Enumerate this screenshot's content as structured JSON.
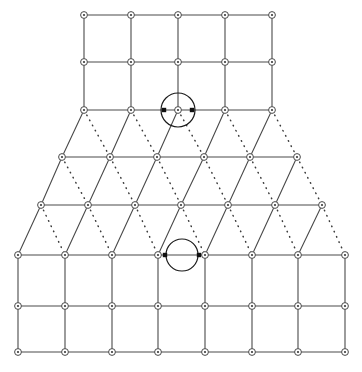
{
  "figure": {
    "title": "",
    "width": 362,
    "height": 372,
    "background_color": "#ffffff",
    "line_color": "#4a4a4a",
    "dotted_line_color": "#3b3b3b",
    "site_fill_color": "#ffffff",
    "site_dot_color": "#3a3a3a",
    "highlight_color": "#1a1a1a",
    "marker_color": "#111111"
  },
  "lattice": {
    "description": "trapezoidal lattice: square grid top, triangular lattice middle, square grid bottom",
    "site_radius": 3.4,
    "site_dot_radius": 1.1,
    "regions": [
      {
        "name": "top-square-grid",
        "type": "square",
        "rows": 3,
        "cols": 5,
        "x_start": 84,
        "x_step": 47,
        "y_start": 15,
        "y_step": 47
      },
      {
        "name": "middle-triangular-lattice",
        "type": "triangular",
        "rows": 4,
        "row_specs": [
          {
            "y": 110,
            "x_start": 84,
            "count": 5,
            "x_step": 47
          },
          {
            "y": 157,
            "x_start": 62,
            "count": 6,
            "x_step": 47
          },
          {
            "y": 205,
            "x_start": 41,
            "count": 7,
            "x_step": 47
          },
          {
            "y": 255,
            "x_start": 18,
            "count": 8,
            "x_step": 47
          }
        ]
      },
      {
        "name": "bottom-square-grid",
        "type": "square",
        "rows": 3,
        "cols": 8,
        "x_start": 18,
        "x_step": 46.7,
        "y_start": 255,
        "y_step": 51
      }
    ]
  },
  "rows": {
    "r0": {
      "y": 15,
      "x": [
        84,
        131,
        178,
        225,
        272
      ],
      "label": "top row"
    },
    "r1": {
      "y": 62,
      "x": [
        84,
        131,
        178,
        225,
        272
      ],
      "label": "second row"
    },
    "r2": {
      "y": 110,
      "x": [
        84,
        131,
        178,
        225,
        272
      ],
      "label": "interface row upper"
    },
    "r3": {
      "y": 157,
      "x": [
        62,
        110,
        157,
        204,
        250,
        297
      ],
      "label": "triangular row 1"
    },
    "r4": {
      "y": 205,
      "x": [
        41,
        88,
        135,
        181,
        228,
        275,
        322
      ],
      "label": "triangular row 2"
    },
    "r5": {
      "y": 255,
      "x": [
        18,
        65,
        112,
        158,
        205,
        252,
        298,
        345
      ],
      "label": "interface row lower"
    },
    "r6": {
      "y": 306,
      "x": [
        18,
        65,
        112,
        158,
        205,
        252,
        298,
        345
      ],
      "label": "bottom second row"
    },
    "r7": {
      "y": 352,
      "x": [
        18,
        65,
        112,
        158,
        205,
        252,
        298,
        345
      ],
      "label": "bottom row"
    }
  },
  "highlights": [
    {
      "name": "site-highlight",
      "type": "site",
      "cx": 178,
      "cy": 110,
      "r": 17,
      "markers": [
        {
          "x": 164,
          "y": 110
        },
        {
          "x": 192,
          "y": 110
        }
      ],
      "marker_size": 4.4
    },
    {
      "name": "bond-highlight",
      "type": "bond",
      "cx": 182,
      "cy": 255,
      "r": 16,
      "markers": [
        {
          "x": 165,
          "y": 255
        },
        {
          "x": 199,
          "y": 255
        }
      ],
      "marker_size": 4.4
    }
  ],
  "legend": {
    "solid_bond_label": "solid bond",
    "dotted_bond_label": "dotted bond",
    "site_label": "lattice site"
  }
}
